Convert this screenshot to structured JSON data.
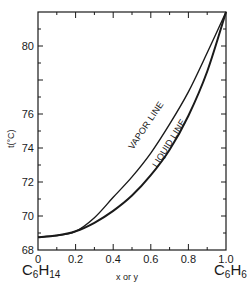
{
  "chart_data": {
    "type": "line",
    "title": "",
    "xlabel": "x or y",
    "ylabel": "t(°C)",
    "xlim": [
      0,
      1.0
    ],
    "ylim": [
      68,
      82
    ],
    "x_ticks": [
      "0",
      "0.2",
      "0.4",
      "0.6",
      "0.8",
      "1.0"
    ],
    "y_ticks": [
      "68",
      "70",
      "72",
      "74",
      "76",
      "80"
    ],
    "y_tick_values": [
      68,
      70,
      72,
      74,
      76,
      80
    ],
    "grid": false,
    "legend": "none (curves labeled inline)",
    "annotations": [
      {
        "text": "VAPOR LINE",
        "x": 0.47,
        "y": 74.5
      },
      {
        "text": "LIQUID LINE",
        "x": 0.62,
        "y": 73.6
      }
    ],
    "endpoint_labels": {
      "left": "C6H14",
      "right": "C6H6"
    },
    "series": [
      {
        "name": "VAPOR LINE",
        "x": [
          0.0,
          0.1,
          0.2,
          0.3,
          0.4,
          0.5,
          0.6,
          0.7,
          0.8,
          0.9,
          1.0
        ],
        "values": [
          68.75,
          68.85,
          69.1,
          69.9,
          71.1,
          72.3,
          73.7,
          75.4,
          77.3,
          79.6,
          82.0
        ]
      },
      {
        "name": "LIQUID LINE",
        "x": [
          0.0,
          0.1,
          0.2,
          0.3,
          0.4,
          0.5,
          0.6,
          0.7,
          0.8,
          0.9,
          1.0
        ],
        "values": [
          68.75,
          68.85,
          69.1,
          69.6,
          70.3,
          71.2,
          72.4,
          73.9,
          75.9,
          78.5,
          82.0
        ]
      }
    ]
  },
  "labels": {
    "y_axis_title": "t(°C)",
    "x_axis_title": "x or y",
    "left_compound": {
      "main1": "C",
      "sub1": "6",
      "main2": "H",
      "sub2": "14"
    },
    "right_compound": {
      "main1": "C",
      "sub1": "6",
      "main2": "H",
      "sub2": "6"
    },
    "vapor_line": "VAPOR LINE",
    "liquid_line": "LIQUID LINE"
  },
  "colors": {
    "ink": "#1a1a1a",
    "background": "#ffffff"
  }
}
